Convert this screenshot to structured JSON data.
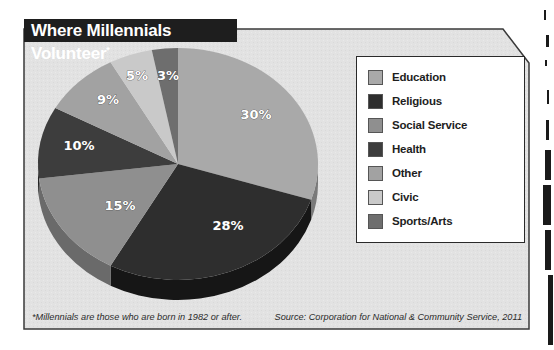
{
  "chart_data": {
    "type": "pie",
    "title": "Where Millennials Volunteer",
    "title_marker": "*",
    "categories": [
      "Education",
      "Religious",
      "Social Service",
      "Health",
      "Other",
      "Civic",
      "Sports/Arts"
    ],
    "values": [
      30,
      28,
      15,
      10,
      9,
      5,
      3
    ],
    "labels": [
      "30%",
      "28%",
      "15%",
      "10%",
      "9%",
      "5%",
      "3%"
    ],
    "colors": [
      "#a9a9a9",
      "#2e2e2e",
      "#8f8f8f",
      "#3d3d3d",
      "#a2a2a2",
      "#c9c9c9",
      "#6e6e6e"
    ],
    "side_colors": [
      "#7a7a7a",
      "#161616",
      "#6a6a6a",
      "#252525",
      "#7c7c7c",
      "#9a9a9a",
      "#4e4e4e"
    ],
    "start_angle": "12 o'clock",
    "direction": "clockwise",
    "style": "3d",
    "legend_position": "right"
  },
  "legend": {
    "items": [
      {
        "label": "Education"
      },
      {
        "label": "Religious"
      },
      {
        "label": "Social Service"
      },
      {
        "label": "Health"
      },
      {
        "label": "Other"
      },
      {
        "label": "Civic"
      },
      {
        "label": "Sports/Arts"
      }
    ]
  },
  "footer": {
    "footnote": "*Millennials are those who are born in 1982 or after.",
    "source": "Source: Corporation for National & Community Service, 2011"
  },
  "colors": {
    "panel_bg": "#e4e4e4",
    "frame_border": "#3a3a3a",
    "title_bg": "#1e1e1e"
  }
}
